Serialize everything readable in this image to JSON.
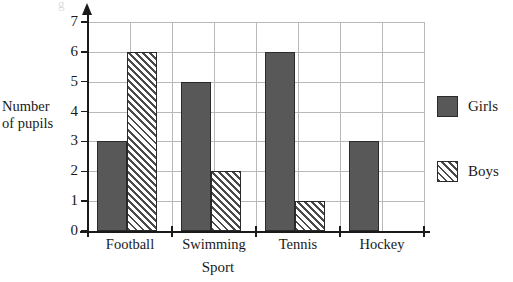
{
  "chart_data": {
    "type": "bar",
    "title": "",
    "subtitle": "",
    "xlabel": "Sport",
    "ylabel": "Number of pupils",
    "categories": [
      "Football",
      "Swimming",
      "Tennis",
      "Hockey"
    ],
    "series": [
      {
        "name": "Girls",
        "values": [
          3,
          5,
          6,
          3
        ],
        "color": "#585858",
        "fill": "solid"
      },
      {
        "name": "Boys",
        "values": [
          6,
          2,
          1,
          0
        ],
        "color": "#4a4a4a",
        "fill": "diagonal-hatch"
      }
    ],
    "ylim": [
      0,
      7
    ],
    "ytick_labels": [
      "0",
      "1",
      "2",
      "3",
      "4",
      "5",
      "6",
      "7"
    ],
    "ytick_values": [
      0,
      1,
      2,
      3,
      4,
      5,
      6,
      7
    ],
    "grid": "both",
    "grid_color": "#b9b9b9",
    "legend_position": "right",
    "legend_entries": [
      "Girls",
      "Boys"
    ],
    "axis_color": "#1a1a1a",
    "y_axis_arrow": true
  },
  "axes": {
    "y_title_line1": "Number",
    "y_title_line2": "of pupils",
    "x_title": "Sport"
  },
  "legend": {
    "items": [
      {
        "label": "Girls",
        "swatch": "solid-gray-swatch"
      },
      {
        "label": "Boys",
        "swatch": "hatched-swatch"
      }
    ]
  },
  "artifact": {
    "bleed_text": "g"
  }
}
